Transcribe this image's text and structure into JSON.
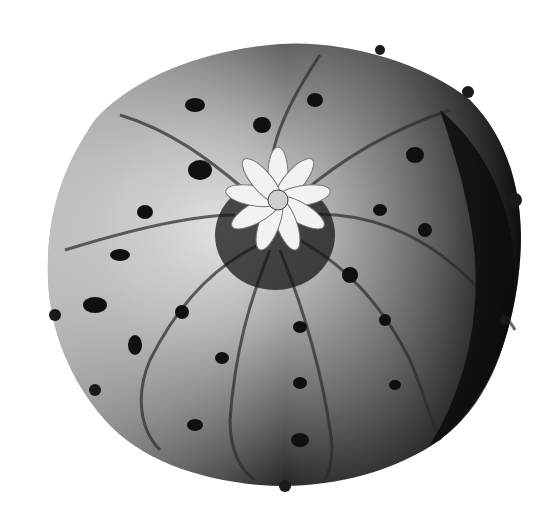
{
  "image": {
    "subject": "cactus viewed from above with flower at center",
    "style": "black and white halftone photograph",
    "colors": {
      "background": "#ffffff",
      "body_light": "#c8c8c8",
      "body_mid": "#6e6e6e",
      "body_dark": "#141414",
      "flower": "#f2f2f2"
    }
  }
}
